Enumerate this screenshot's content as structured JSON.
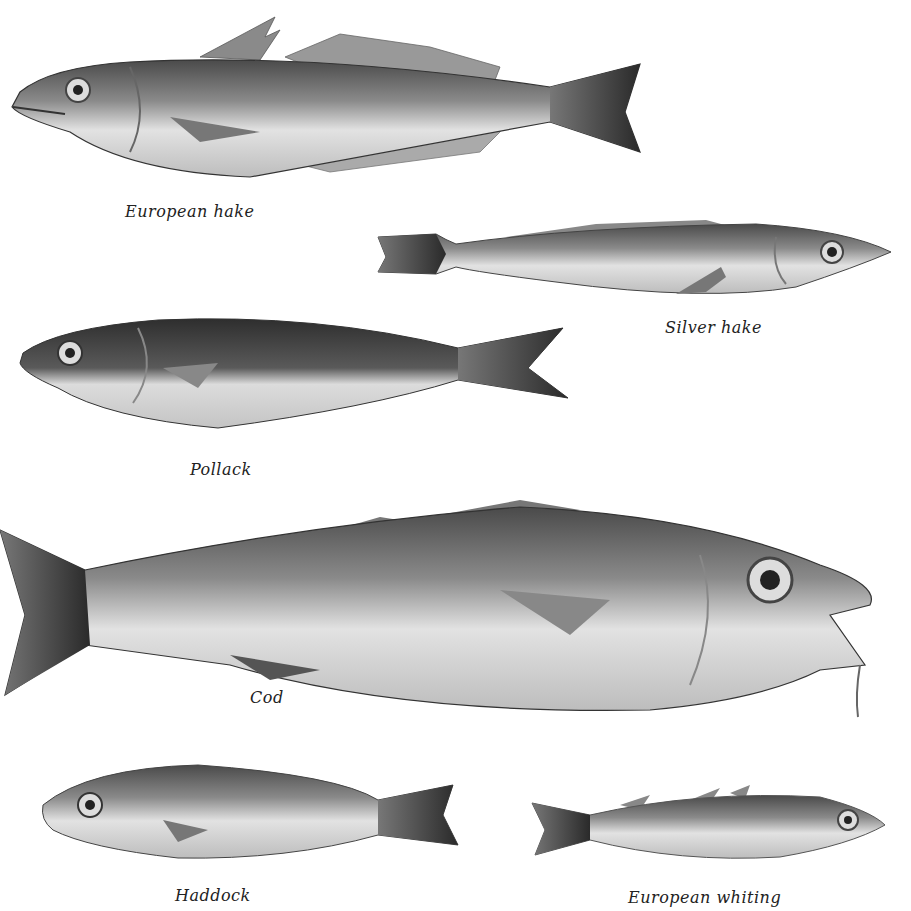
{
  "plate": {
    "background": "#ffffff",
    "ink_color": "#222222",
    "fish": [
      {
        "id": "european-hake",
        "caption": "European hake",
        "facing": "left"
      },
      {
        "id": "silver-hake",
        "caption": "Silver hake",
        "facing": "right"
      },
      {
        "id": "pollack",
        "caption": "Pollack",
        "facing": "left"
      },
      {
        "id": "cod",
        "caption": "Cod",
        "facing": "right"
      },
      {
        "id": "haddock",
        "caption": "Haddock",
        "facing": "left"
      },
      {
        "id": "european-whiting",
        "caption": "European whiting",
        "facing": "right"
      }
    ]
  }
}
